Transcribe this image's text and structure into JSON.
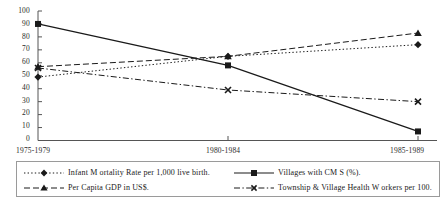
{
  "chart_data": {
    "type": "line",
    "title": "",
    "subtitle": "",
    "xlabel": "",
    "ylabel": "",
    "categories": [
      "1975-1979",
      "1980-1984",
      "1985-1989"
    ],
    "ylim": [
      0,
      100
    ],
    "yticks": [
      0,
      10,
      20,
      30,
      40,
      50,
      60,
      70,
      80,
      90,
      100
    ],
    "grid": false,
    "legend_position": "bottom",
    "series": [
      {
        "name": "Infant M ortality Rate per 1,000 live birth.",
        "values": [
          49,
          65,
          74
        ],
        "marker": "diamond",
        "linestyle": "dotted",
        "color": "#1a1a1a"
      },
      {
        "name": "Per Capita GDP in US$.",
        "values": [
          57,
          65,
          83
        ],
        "marker": "triangle",
        "linestyle": "dashed",
        "color": "#1a1a1a"
      },
      {
        "name": "Villages with CM S (%).",
        "values": [
          90,
          58,
          7
        ],
        "marker": "square",
        "linestyle": "solid",
        "color": "#1a1a1a"
      },
      {
        "name": "Township & Village Health W orkers per 100.",
        "values": [
          56,
          39,
          30
        ],
        "marker": "x",
        "linestyle": "dashdot",
        "color": "#1a1a1a"
      }
    ]
  },
  "axis": {
    "y_tick_labels": [
      "100",
      "90",
      "80",
      "70",
      "60",
      "50",
      "40",
      "30",
      "20",
      "10",
      "0"
    ],
    "x_tick_labels": [
      "1975-1979",
      "1980-1984",
      "1985-1989"
    ]
  },
  "legend": {
    "items": [
      {
        "label": "Infant M ortality Rate per 1,000 live birth."
      },
      {
        "label": "Per Capita GDP in US$."
      },
      {
        "label": "Villages with CM S (%)."
      },
      {
        "label": "Township & Village Health W orkers per 100."
      }
    ]
  }
}
